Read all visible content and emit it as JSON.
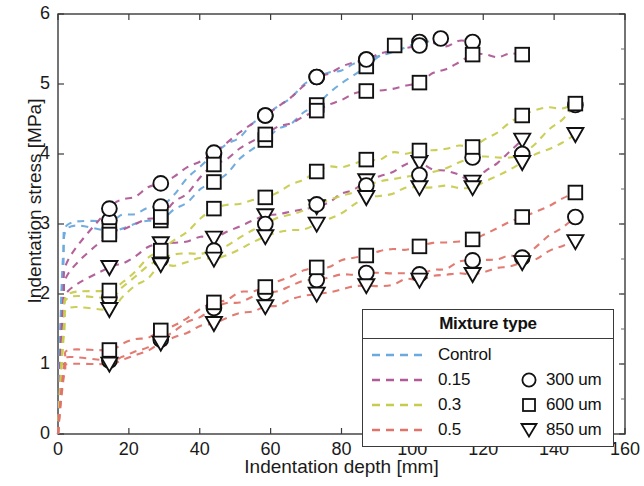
{
  "chart_data": {
    "type": "line",
    "title": "",
    "xlabel": "Indentation depth [mm]",
    "ylabel": "Indentation stress [MPa]",
    "xlim": [
      0,
      160
    ],
    "ylim": [
      0,
      6
    ],
    "xticks": [
      0,
      20,
      40,
      60,
      80,
      100,
      120,
      140,
      160
    ],
    "yticks": [
      0,
      1,
      2,
      3,
      4,
      5,
      6
    ],
    "grid": false,
    "linestyle": "dashed",
    "legend": {
      "position": "lower-right",
      "title": "Mixture type",
      "color_entries": [
        {
          "label": "Control",
          "color": "#6ca9dd"
        },
        {
          "label": "0.15",
          "color": "#b05a96"
        },
        {
          "label": "0.3",
          "color": "#c8cc4e"
        },
        {
          "label": "0.5",
          "color": "#e0746a"
        }
      ],
      "marker_entries": [
        {
          "label": "300 um",
          "marker": "circle"
        },
        {
          "label": "600 um",
          "marker": "square"
        },
        {
          "label": "850 um",
          "marker": "triangle-down"
        }
      ]
    },
    "series": [
      {
        "name": "Control 300 um",
        "color": "#6ca9dd",
        "marker": "circle",
        "x": [
          0,
          0.6,
          1.5,
          3,
          14.5,
          29,
          44,
          58.5,
          73,
          87,
          102,
          108
        ],
        "y": [
          0,
          1.4,
          2.6,
          3.0,
          3.05,
          3.25,
          4.0,
          4.55,
          5.1,
          5.35,
          5.6,
          5.65
        ]
      },
      {
        "name": "Control 600 um",
        "color": "#6ca9dd",
        "marker": "square",
        "x": [
          0,
          0.6,
          1.5,
          3,
          14.5,
          29,
          44,
          58.5,
          73,
          87,
          95
        ],
        "y": [
          0,
          1.3,
          2.4,
          2.95,
          2.9,
          3.05,
          3.6,
          4.2,
          4.7,
          5.25,
          5.55
        ]
      },
      {
        "name": "0.15 300 um",
        "color": "#b05a96",
        "marker": "circle",
        "x": [
          0,
          0.7,
          1.6,
          3,
          14.5,
          29,
          44,
          58.5,
          73,
          87,
          102,
          117
        ],
        "y": [
          0,
          1.1,
          2.0,
          2.5,
          3.22,
          3.58,
          4.02,
          4.55,
          5.1,
          5.35,
          5.55,
          5.6
        ]
      },
      {
        "name": "0.15 600 um",
        "color": "#b05a96",
        "marker": "square",
        "x": [
          0,
          0.7,
          1.6,
          3,
          14.5,
          29,
          44,
          58.5,
          73,
          87,
          102,
          117,
          131
        ],
        "y": [
          0,
          1.0,
          1.85,
          2.3,
          2.85,
          3.1,
          3.85,
          4.28,
          4.62,
          4.9,
          5.02,
          5.42,
          5.42
        ]
      },
      {
        "name": "0.15 850 um",
        "color": "#b05a96",
        "marker": "triangle-down",
        "x": [
          0,
          0.7,
          1.6,
          3,
          14.5,
          29,
          44,
          58.5,
          73,
          87,
          102,
          117,
          131
        ],
        "y": [
          0,
          0.9,
          1.7,
          2.05,
          2.38,
          2.72,
          2.8,
          3.12,
          3.25,
          3.62,
          3.88,
          3.6,
          4.2
        ]
      },
      {
        "name": "0.3 300 um",
        "color": "#c8cc4e",
        "marker": "circle",
        "x": [
          0,
          0.8,
          1.8,
          3,
          14.5,
          29,
          44,
          58.5,
          73,
          87,
          102,
          117,
          131,
          146
        ],
        "y": [
          0,
          0.85,
          1.6,
          1.95,
          1.95,
          2.5,
          2.62,
          3.0,
          3.28,
          3.55,
          3.7,
          3.95,
          4.0,
          4.7
        ]
      },
      {
        "name": "0.3 600 um",
        "color": "#c8cc4e",
        "marker": "square",
        "x": [
          0,
          0.8,
          1.8,
          3,
          14.5,
          29,
          44,
          58.5,
          73,
          87,
          102,
          117,
          131,
          146
        ],
        "y": [
          0,
          0.85,
          1.62,
          2.0,
          2.05,
          2.62,
          3.22,
          3.38,
          3.75,
          3.92,
          4.05,
          4.1,
          4.55,
          4.72
        ]
      },
      {
        "name": "0.3 850 um",
        "color": "#c8cc4e",
        "marker": "triangle-down",
        "x": [
          0,
          0.8,
          1.8,
          3,
          14.5,
          29,
          44,
          58.5,
          73,
          87,
          102,
          117,
          131,
          146
        ],
        "y": [
          0,
          0.8,
          1.48,
          1.8,
          1.78,
          2.42,
          2.5,
          2.82,
          3.0,
          3.38,
          3.52,
          3.52,
          3.88,
          4.28
        ]
      },
      {
        "name": "0.5 300 um",
        "color": "#e0746a",
        "marker": "circle",
        "x": [
          0,
          0.9,
          2,
          3.2,
          14.5,
          29,
          44,
          58.5,
          73,
          87,
          102,
          117,
          131,
          146
        ],
        "y": [
          0,
          0.55,
          1.0,
          1.1,
          1.05,
          1.35,
          1.8,
          2.02,
          2.2,
          2.3,
          2.28,
          2.48,
          2.52,
          3.1
        ]
      },
      {
        "name": "0.5 600 um",
        "color": "#e0746a",
        "marker": "square",
        "x": [
          0,
          0.9,
          2,
          3.2,
          14.5,
          29,
          44,
          58.5,
          73,
          87,
          102,
          117,
          131,
          146
        ],
        "y": [
          0,
          0.6,
          1.05,
          1.2,
          1.2,
          1.48,
          1.88,
          2.1,
          2.38,
          2.55,
          2.68,
          2.78,
          3.1,
          3.45
        ]
      },
      {
        "name": "0.5 850 um",
        "color": "#e0746a",
        "marker": "triangle-down",
        "x": [
          0,
          0.9,
          2,
          3.2,
          14.5,
          29,
          44,
          58.5,
          73,
          87,
          102,
          117,
          131,
          146
        ],
        "y": [
          0,
          0.5,
          0.92,
          1.0,
          1.0,
          1.3,
          1.58,
          1.82,
          2.0,
          2.12,
          2.2,
          2.28,
          2.45,
          2.75
        ]
      }
    ]
  }
}
